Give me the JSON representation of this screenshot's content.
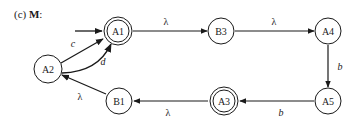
{
  "title": {
    "prefix": "(c)",
    "name": "M",
    "suffix": ":"
  },
  "colors": {
    "stroke": "#1a1a1a",
    "background": "#ffffff"
  },
  "nodes": [
    {
      "id": "A1",
      "label": "A1",
      "x": 118,
      "y": 31,
      "accepting": true,
      "start": true
    },
    {
      "id": "B3",
      "label": "B3",
      "x": 221,
      "y": 31,
      "accepting": false
    },
    {
      "id": "A4",
      "label": "A4",
      "x": 328,
      "y": 31,
      "accepting": false
    },
    {
      "id": "A2",
      "label": "A2",
      "x": 48,
      "y": 69,
      "accepting": false
    },
    {
      "id": "B1",
      "label": "B1",
      "x": 119,
      "y": 101,
      "accepting": false
    },
    {
      "id": "A3",
      "label": "A3",
      "x": 224,
      "y": 101,
      "accepting": true
    },
    {
      "id": "A5",
      "label": "A5",
      "x": 328,
      "y": 101,
      "accepting": false
    }
  ],
  "edges": [
    {
      "from": "A1",
      "to": "B3",
      "label": "λ"
    },
    {
      "from": "B3",
      "to": "A4",
      "label": "λ"
    },
    {
      "from": "A4",
      "to": "A5",
      "label": "b"
    },
    {
      "from": "A5",
      "to": "A3",
      "label": "b"
    },
    {
      "from": "A3",
      "to": "B1",
      "label": "λ"
    },
    {
      "from": "B1",
      "to": "A2",
      "label": "λ"
    },
    {
      "from": "A2",
      "to": "A1",
      "label": "c"
    },
    {
      "from": "A2",
      "to": "A1",
      "label": "d"
    }
  ]
}
